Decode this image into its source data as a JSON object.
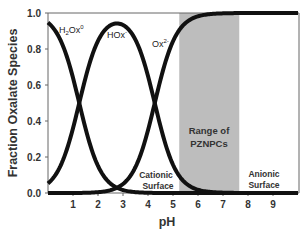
{
  "chart_data": {
    "type": "line",
    "title": "",
    "xlabel": "pH",
    "ylabel": "Fraction Oxalate Species",
    "xlim": [
      0,
      10
    ],
    "ylim": [
      0,
      1.0
    ],
    "x_ticks": [
      "1",
      "2",
      "3",
      "4",
      "5",
      "6",
      "7",
      "8",
      "9"
    ],
    "y_ticks": [
      "0.0",
      "0.2",
      "0.4",
      "0.6",
      "0.8",
      "1.0"
    ],
    "grid": false,
    "legend": "none (inline curve labels)",
    "pKa": [
      1.25,
      4.27
    ],
    "x": [
      0,
      0.5,
      1,
      1.25,
      1.5,
      2,
      2.5,
      2.75,
      3,
      3.5,
      4,
      4.27,
      4.5,
      5,
      5.5,
      6,
      7,
      8,
      9,
      10
    ],
    "series": [
      {
        "name": "H2Ox0",
        "label": "H₂Ox°",
        "values": [
          0.95,
          0.85,
          0.64,
          0.5,
          0.36,
          0.15,
          0.05,
          0.03,
          0.02,
          0.005,
          0.001,
          0.0,
          0.0,
          0.0,
          0.0,
          0.0,
          0.0,
          0.0,
          0.0,
          0.0
        ]
      },
      {
        "name": "HOx-",
        "label": "HOx⁻",
        "values": [
          0.05,
          0.15,
          0.36,
          0.5,
          0.64,
          0.84,
          0.91,
          0.94,
          0.93,
          0.84,
          0.64,
          0.5,
          0.37,
          0.16,
          0.06,
          0.02,
          0.002,
          0.0,
          0.0,
          0.0
        ]
      },
      {
        "name": "Ox2-",
        "label": "Ox²⁻",
        "values": [
          0.0,
          0.0,
          0.0,
          0.0,
          0.0,
          0.01,
          0.04,
          0.03,
          0.05,
          0.155,
          0.36,
          0.5,
          0.63,
          0.84,
          0.94,
          0.98,
          0.998,
          1.0,
          1.0,
          1.0
        ]
      }
    ],
    "shaded_region": {
      "x_start": 5.25,
      "x_end": 7.65,
      "color": "#bdbdbd",
      "label_line1": "Range of",
      "label_line2": "PZNPCs"
    },
    "annotations": [
      {
        "text_line1": "Cationic",
        "text_line2": "Surface",
        "x": 4.4,
        "y": 0.1
      },
      {
        "text_line1": "Anionic",
        "text_line2": "Surface",
        "x": 8.8,
        "y": 0.1
      }
    ]
  },
  "labels": {
    "ylabel": "Fraction Oxalate Species",
    "xlabel": "pH",
    "species_h2ox_main": "H",
    "species_h2ox_sub": "2",
    "species_h2ox_rest": "Ox",
    "species_h2ox_sup": "0",
    "species_hox_main": "HOx",
    "species_hox_sup": "-",
    "species_ox_main": "Ox",
    "species_ox_sup": "2-",
    "range_line1": "Range of",
    "range_line2": "PZNPCs",
    "cationic_line1": "Cationic",
    "cationic_line2": "Surface",
    "anionic_line1": "Anionic",
    "anionic_line2": "Surface"
  },
  "colors": {
    "curve": "#111111",
    "axis": "#555555",
    "shade": "#bdbdbd",
    "text": "#333333"
  }
}
